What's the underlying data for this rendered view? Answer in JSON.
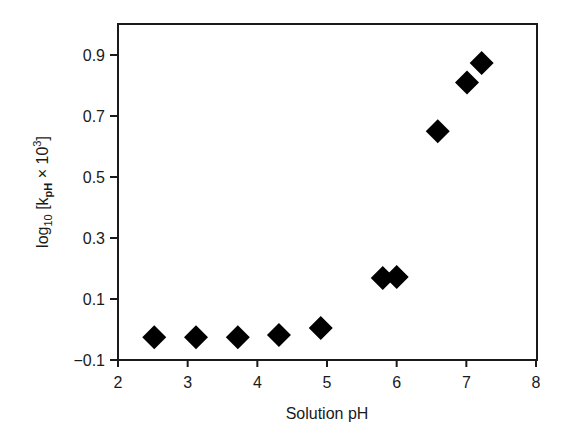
{
  "chart_data": {
    "type": "scatter",
    "title": "",
    "xlabel": "Solution pH",
    "ylabel": {
      "prefix": "log",
      "prefix_sub": "10",
      "open": " [k",
      "k_sub": "pH",
      "times": " × 10",
      "exp": "3",
      "close": "]",
      "full_text": "log10 [kpH × 10^3]"
    },
    "xlim": [
      2,
      8
    ],
    "ylim": [
      -0.1,
      1.0
    ],
    "xticks": [
      2,
      3,
      4,
      5,
      6,
      7,
      8
    ],
    "xtick_labels": [
      "2",
      "3",
      "4",
      "5",
      "6",
      "7",
      "8"
    ],
    "yticks": [
      -0.1,
      0.1,
      0.3,
      0.5,
      0.7,
      0.9
    ],
    "ytick_labels": [
      "−0.1",
      "0.1",
      "0.3",
      "0.5",
      "0.7",
      "0.9"
    ],
    "grid": false,
    "legend": null,
    "marker": "diamond",
    "marker_color": "#000000",
    "series": [
      {
        "name": "log10 kpH",
        "points": [
          {
            "x": 2.52,
            "y": -0.025
          },
          {
            "x": 3.12,
            "y": -0.025
          },
          {
            "x": 3.72,
            "y": -0.025
          },
          {
            "x": 4.31,
            "y": -0.018
          },
          {
            "x": 4.91,
            "y": 0.005
          },
          {
            "x": 5.8,
            "y": 0.169
          },
          {
            "x": 6.0,
            "y": 0.172
          },
          {
            "x": 6.59,
            "y": 0.65
          },
          {
            "x": 7.01,
            "y": 0.81
          },
          {
            "x": 7.22,
            "y": 0.874
          }
        ]
      }
    ]
  },
  "colors": {
    "axis": "#1a1a1a",
    "marker": "#000000",
    "background": "#ffffff"
  }
}
